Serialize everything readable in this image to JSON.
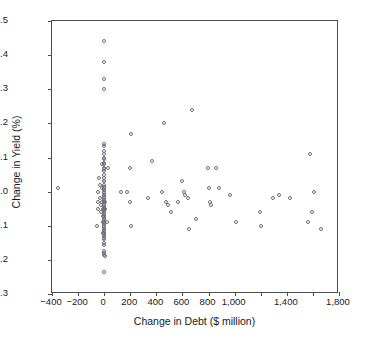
{
  "chart_data": {
    "type": "scatter",
    "title": "",
    "xlabel": "Change in Debt ($ million)",
    "ylabel": "Change in Yield (%)",
    "xlim": [
      -400,
      1800
    ],
    "ylim": [
      -0.3,
      0.5
    ],
    "grid": false,
    "legend": null,
    "marker": "open-circle",
    "marker_color": "#6e6e77",
    "xticks": [
      -400,
      -200,
      0,
      200,
      400,
      600,
      800,
      1000,
      1200,
      1400,
      1600,
      1800
    ],
    "xticklabels": [
      "−400",
      "−200",
      "0",
      "200",
      "400",
      "600",
      "800",
      "1,000",
      "",
      "1,400",
      "",
      "1,800"
    ],
    "yticks": [
      -0.3,
      -0.2,
      -0.1,
      0.0,
      0.1,
      0.2,
      0.3,
      0.4,
      0.5
    ],
    "yticklabels": [
      "−0.3",
      "−0.2",
      "−0.1",
      "0.0",
      "0.1",
      "0.2",
      "0.3",
      "0.4",
      "0.5"
    ],
    "points": [
      [
        -355,
        0.01
      ],
      [
        -40,
        0.04
      ],
      [
        -45,
        0.0
      ],
      [
        -48,
        -0.03
      ],
      [
        -50,
        -0.05
      ],
      [
        -52,
        -0.1
      ],
      [
        -35,
        0.02
      ],
      [
        -30,
        -0.02
      ],
      [
        -28,
        -0.06
      ],
      [
        -25,
        -0.04
      ],
      [
        -20,
        0.08
      ],
      [
        -18,
        0.01
      ],
      [
        -15,
        -0.03
      ],
      [
        -12,
        -0.07
      ],
      [
        -10,
        -0.05
      ],
      [
        -8,
        -0.09
      ],
      [
        -6,
        -0.12
      ],
      [
        -5,
        0.03
      ],
      [
        0,
        0.44
      ],
      [
        0,
        0.38
      ],
      [
        0,
        0.33
      ],
      [
        2,
        0.3
      ],
      [
        0,
        0.14
      ],
      [
        2,
        0.135
      ],
      [
        0,
        0.12
      ],
      [
        2,
        0.11
      ],
      [
        0,
        0.1
      ],
      [
        2,
        0.095
      ],
      [
        0,
        0.085
      ],
      [
        2,
        0.08
      ],
      [
        0,
        0.07
      ],
      [
        2,
        0.065
      ],
      [
        0,
        0.06
      ],
      [
        2,
        0.05
      ],
      [
        0,
        0.04
      ],
      [
        2,
        0.03
      ],
      [
        0,
        0.02
      ],
      [
        2,
        0.015
      ],
      [
        0,
        0.01
      ],
      [
        2,
        0.005
      ],
      [
        0,
        0.0
      ],
      [
        2,
        -0.005
      ],
      [
        0,
        -0.01
      ],
      [
        2,
        -0.015
      ],
      [
        0,
        -0.02
      ],
      [
        2,
        -0.025
      ],
      [
        0,
        -0.03
      ],
      [
        2,
        -0.03
      ],
      [
        4,
        -0.03
      ],
      [
        0,
        -0.035
      ],
      [
        2,
        -0.04
      ],
      [
        0,
        -0.045
      ],
      [
        2,
        -0.05
      ],
      [
        0,
        -0.05
      ],
      [
        4,
        -0.05
      ],
      [
        0,
        -0.055
      ],
      [
        2,
        -0.06
      ],
      [
        0,
        -0.065
      ],
      [
        2,
        -0.07
      ],
      [
        0,
        -0.075
      ],
      [
        2,
        -0.08
      ],
      [
        0,
        -0.085
      ],
      [
        2,
        -0.09
      ],
      [
        0,
        -0.095
      ],
      [
        2,
        -0.1
      ],
      [
        0,
        -0.105
      ],
      [
        2,
        -0.11
      ],
      [
        0,
        -0.115
      ],
      [
        2,
        -0.12
      ],
      [
        0,
        -0.125
      ],
      [
        2,
        -0.13
      ],
      [
        0,
        -0.135
      ],
      [
        2,
        -0.14
      ],
      [
        0,
        -0.15
      ],
      [
        2,
        -0.155
      ],
      [
        0,
        -0.175
      ],
      [
        2,
        -0.18
      ],
      [
        0,
        -0.185
      ],
      [
        4,
        -0.19
      ],
      [
        2,
        -0.235
      ],
      [
        30,
        0.07
      ],
      [
        20,
        -0.09
      ],
      [
        130,
        0.0
      ],
      [
        175,
        0.0
      ],
      [
        195,
        0.07
      ],
      [
        205,
        0.17
      ],
      [
        200,
        -0.03
      ],
      [
        205,
        -0.1
      ],
      [
        335,
        -0.02
      ],
      [
        365,
        0.09
      ],
      [
        440,
        0.0
      ],
      [
        460,
        0.2
      ],
      [
        470,
        -0.03
      ],
      [
        490,
        -0.04
      ],
      [
        510,
        -0.06
      ],
      [
        565,
        -0.03
      ],
      [
        600,
        0.03
      ],
      [
        615,
        0.0
      ],
      [
        620,
        -0.01
      ],
      [
        640,
        -0.02
      ],
      [
        650,
        -0.11
      ],
      [
        675,
        0.24
      ],
      [
        700,
        -0.08
      ],
      [
        795,
        0.07
      ],
      [
        800,
        0.01
      ],
      [
        810,
        -0.03
      ],
      [
        815,
        -0.04
      ],
      [
        860,
        0.07
      ],
      [
        880,
        0.01
      ],
      [
        965,
        -0.01
      ],
      [
        1010,
        -0.09
      ],
      [
        1195,
        -0.06
      ],
      [
        1200,
        -0.1
      ],
      [
        1295,
        -0.02
      ],
      [
        1340,
        -0.01
      ],
      [
        1425,
        -0.02
      ],
      [
        1575,
        0.11
      ],
      [
        1560,
        -0.09
      ],
      [
        1590,
        -0.06
      ],
      [
        1610,
        0.0
      ],
      [
        1660,
        -0.11
      ]
    ]
  }
}
